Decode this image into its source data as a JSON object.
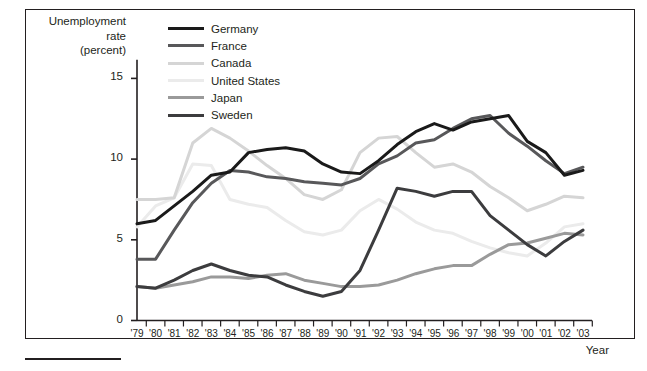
{
  "figure": {
    "y_axis_title": "Unemployment\nrate\n(percent)",
    "x_axis_title": "Year"
  },
  "legend": {
    "position": "top-left-inside",
    "items": [
      {
        "label": "Germany",
        "color": "#1a1a1a"
      },
      {
        "label": "France",
        "color": "#58585a"
      },
      {
        "label": "Canada",
        "color": "#d5d5d5"
      },
      {
        "label": "United States",
        "color": "#ebebeb"
      },
      {
        "label": "Japan",
        "color": "#9a9a9a"
      },
      {
        "label": "Sweden",
        "color": "#3c3c3e"
      }
    ]
  },
  "chart_data": {
    "type": "line",
    "title": "",
    "xlabel": "Year",
    "ylabel": "Unemployment rate (percent)",
    "xlim": [
      1979,
      2003
    ],
    "ylim": [
      0,
      16.2
    ],
    "yticks": [
      0,
      5,
      10,
      15
    ],
    "ytick_labels": [
      "0",
      "5",
      "10",
      "15"
    ],
    "grid": false,
    "x": [
      1979,
      1980,
      1981,
      1982,
      1983,
      1984,
      1985,
      1986,
      1987,
      1988,
      1989,
      1990,
      1991,
      1992,
      1993,
      1994,
      1995,
      1996,
      1997,
      1998,
      1999,
      2000,
      2001,
      2002,
      2003
    ],
    "xtick_labels": [
      "'79",
      "'80",
      "'81",
      "'82",
      "'83",
      "'84",
      "'85",
      "'86",
      "'87",
      "'88",
      "'89",
      "'90",
      "'91",
      "'92",
      "'93",
      "'94",
      "'95",
      "'96",
      "'97",
      "'98",
      "'99",
      "'00",
      "'01",
      "'02",
      "'03"
    ],
    "series": [
      {
        "name": "Germany",
        "color": "#1a1a1a",
        "values": [
          6.0,
          6.2,
          7.1,
          8.0,
          9.0,
          9.2,
          10.4,
          10.6,
          10.7,
          10.5,
          9.7,
          9.2,
          9.1,
          9.9,
          10.9,
          11.7,
          12.2,
          11.8,
          12.3,
          12.5,
          12.7,
          11.1,
          10.4,
          9.0,
          9.3
        ],
        "linewidth": 3.0
      },
      {
        "name": "France",
        "color": "#58585a",
        "values": [
          3.8,
          3.8,
          5.6,
          7.3,
          8.5,
          9.3,
          9.2,
          8.9,
          8.8,
          8.6,
          8.5,
          8.4,
          8.8,
          9.7,
          10.2,
          11.0,
          11.2,
          11.9,
          12.5,
          12.7,
          11.6,
          10.8,
          9.9,
          9.1,
          9.5
        ],
        "linewidth": 3.0
      },
      {
        "name": "Canada",
        "color": "#d5d5d5",
        "values": [
          7.5,
          7.5,
          7.6,
          11.0,
          11.9,
          11.3,
          10.5,
          9.6,
          8.8,
          7.8,
          7.5,
          8.1,
          10.4,
          11.3,
          11.4,
          10.4,
          9.5,
          9.7,
          9.2,
          8.3,
          7.6,
          6.8,
          7.2,
          7.7,
          7.6
        ],
        "linewidth": 3.0
      },
      {
        "name": "United States",
        "color": "#ebebeb",
        "values": [
          5.8,
          7.1,
          7.6,
          9.7,
          9.6,
          7.5,
          7.2,
          7.0,
          6.2,
          5.5,
          5.3,
          5.6,
          6.8,
          7.5,
          6.9,
          6.1,
          5.6,
          5.4,
          4.9,
          4.5,
          4.2,
          4.0,
          4.8,
          5.8,
          6.0
        ],
        "linewidth": 3.0
      },
      {
        "name": "Japan",
        "color": "#9a9a9a",
        "values": [
          2.1,
          2.0,
          2.2,
          2.4,
          2.7,
          2.7,
          2.6,
          2.8,
          2.9,
          2.5,
          2.3,
          2.1,
          2.1,
          2.2,
          2.5,
          2.9,
          3.2,
          3.4,
          3.4,
          4.1,
          4.7,
          4.8,
          5.1,
          5.4,
          5.3
        ],
        "linewidth": 3.0
      },
      {
        "name": "Sweden",
        "color": "#3c3c3e",
        "values": [
          2.1,
          2.0,
          2.5,
          3.1,
          3.5,
          3.1,
          2.8,
          2.7,
          2.2,
          1.8,
          1.5,
          1.8,
          3.1,
          5.6,
          8.2,
          8.0,
          7.7,
          8.0,
          8.0,
          6.5,
          5.6,
          4.7,
          4.0,
          4.9,
          5.6
        ],
        "linewidth": 3.0
      }
    ]
  }
}
